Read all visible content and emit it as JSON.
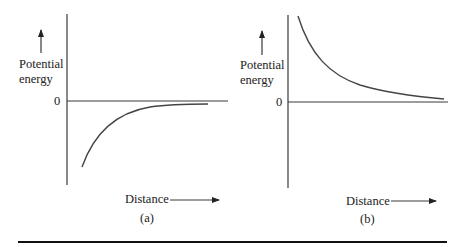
{
  "figure": {
    "panels": [
      {
        "id": "a",
        "caption": "(a)",
        "y_axis_label_line1": "Potential",
        "y_axis_label_line2": "energy",
        "zero_label": "0",
        "x_axis_label": "Distance",
        "curve_description": "attractive: negative potential energy rising toward 0 as distance increases"
      },
      {
        "id": "b",
        "caption": "(b)",
        "y_axis_label_line1": "Potential",
        "y_axis_label_line2": "energy",
        "zero_label": "0",
        "x_axis_label": "Distance",
        "curve_description": "repulsive: positive potential energy decaying toward 0 as distance increases"
      }
    ]
  },
  "colors": {
    "axis": "#3a3a3a",
    "curve": "#444444",
    "text": "#222222",
    "rule": "#111111",
    "background": "#ffffff"
  }
}
